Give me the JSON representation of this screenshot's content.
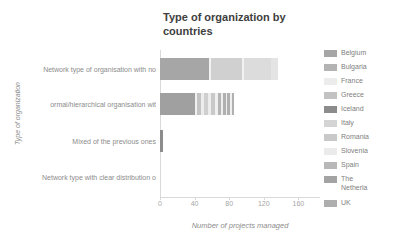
{
  "chart_data": {
    "type": "bar",
    "orientation": "horizontal",
    "stacked": true,
    "title": "Type of organization by\ncountries",
    "xlabel": "Number of projects managed",
    "ylabel": "Type of organization",
    "xlim": [
      0,
      170
    ],
    "xticks": [
      0,
      40,
      80,
      120,
      160
    ],
    "grid": false,
    "legend_position": "right",
    "categories": [
      "Network type of organisation with no",
      "ormal/hierarchical organisation wit",
      "Mixed of the previous ones",
      "Network type with clear distribution o"
    ],
    "series": [
      {
        "name": "Belgium",
        "color": "#a6a6a6",
        "values": [
          57,
          40,
          0,
          0
        ]
      },
      {
        "name": "Bulgaria",
        "color": "#b3b3b3",
        "values": [
          0,
          3,
          0,
          0
        ]
      },
      {
        "name": "France",
        "color": "#e8e8e8",
        "values": [
          2,
          4,
          0,
          0
        ]
      },
      {
        "name": "Greece",
        "color": "#bfbfbf",
        "values": [
          0,
          5,
          0,
          0
        ]
      },
      {
        "name": "Iceland",
        "color": "#8c8c8c",
        "values": [
          0,
          9,
          3,
          0
        ]
      },
      {
        "name": "Italy",
        "color": "#d6d6d6",
        "values": [
          36,
          5,
          0,
          0
        ]
      },
      {
        "name": "Romania",
        "color": "#c9c9c9",
        "values": [
          0,
          6,
          0,
          0
        ]
      },
      {
        "name": "Slovenia",
        "color": "#ededed",
        "values": [
          11,
          4,
          0,
          0
        ]
      },
      {
        "name": "Spain",
        "color": "#b8b8b8",
        "values": [
          0,
          5,
          0,
          0
        ]
      },
      {
        "name": "The\nNetherla",
        "color": "#a3a3a3",
        "values": [
          0,
          4,
          0,
          0
        ]
      },
      {
        "name": "UK",
        "color": "#aeaeae",
        "values": [
          31,
          3,
          0,
          0
        ]
      }
    ],
    "bar_segments": [
      [
        {
          "series": "Belgium",
          "value": 57,
          "color": "#a6a6a6"
        },
        {
          "series": "France",
          "value": 2,
          "color": "#f2f2f2"
        },
        {
          "series": "Italy",
          "value": 36,
          "color": "#d0d0d0"
        },
        {
          "series": "Slovenia",
          "value": 2,
          "color": "#f2f2f2"
        },
        {
          "series": "UK",
          "value": 31,
          "color": "#dcdcdc"
        },
        {
          "series": "Spain",
          "value": 9,
          "color": "#e4e4e4"
        }
      ],
      [
        {
          "series": "Belgium",
          "value": 40,
          "color": "#a0a0a0"
        },
        {
          "series": "France",
          "value": 3,
          "color": "#f0f0f0"
        },
        {
          "series": "Greece",
          "value": 5,
          "color": "#c4c4c4"
        },
        {
          "series": "Iceland",
          "value": 3,
          "color": "#ededed"
        },
        {
          "series": "Italy",
          "value": 5,
          "color": "#cfcfcf"
        },
        {
          "series": "Romania",
          "value": 3,
          "color": "#ededed"
        },
        {
          "series": "Slovenia",
          "value": 5,
          "color": "#c9c9c9"
        },
        {
          "series": "Spain",
          "value": 3,
          "color": "#f0f0f0"
        },
        {
          "series": "The Netherla",
          "value": 4,
          "color": "#b5b5b5"
        },
        {
          "series": "UK",
          "value": 2,
          "color": "#eeeeee"
        },
        {
          "series": "Bulgaria",
          "value": 3,
          "color": "#b0b0b0"
        },
        {
          "series": "Greece2",
          "value": 2,
          "color": "#efefef"
        },
        {
          "series": "Iceland2",
          "value": 3,
          "color": "#b0b0b0"
        },
        {
          "series": "Romania2",
          "value": 2,
          "color": "#efefef"
        },
        {
          "series": "Spain2",
          "value": 3,
          "color": "#b0b0b0"
        }
      ],
      [
        {
          "series": "Iceland",
          "value": 3,
          "color": "#8c8c8c"
        }
      ],
      [
        {
          "series": "Iceland",
          "value": 0.6,
          "color": "#d9d9d9"
        }
      ]
    ]
  },
  "legend": {
    "items": [
      {
        "label": "Belgium",
        "color": "#a6a6a6"
      },
      {
        "label": "Bulgaria",
        "color": "#b3b3b3"
      },
      {
        "label": "France",
        "color": "#ececec"
      },
      {
        "label": "Greece",
        "color": "#c2c2c2"
      },
      {
        "label": "Iceland",
        "color": "#8c8c8c"
      },
      {
        "label": "Italy",
        "color": "#d4d4d4"
      },
      {
        "label": "Romania",
        "color": "#c9c9c9"
      },
      {
        "label": "Slovenia",
        "color": "#ebebeb"
      },
      {
        "label": "Spain",
        "color": "#b8b8b8"
      },
      {
        "label": "The\nNetherla",
        "color": "#a3a3a3"
      },
      {
        "label": "UK",
        "color": "#aeaeae"
      }
    ]
  }
}
